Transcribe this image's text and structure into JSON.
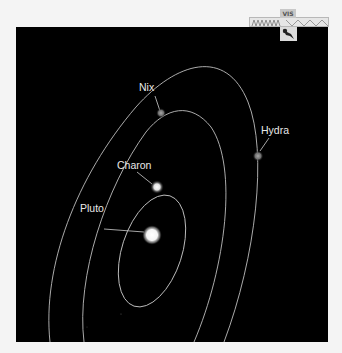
{
  "diagram": {
    "background_color": "#000000",
    "orbit_color": "#bdbdbd",
    "label_color": "#e8e8e8",
    "bodies": [
      {
        "name": "Pluto",
        "label": "Pluto"
      },
      {
        "name": "Charon",
        "label": "Charon"
      },
      {
        "name": "Nix",
        "label": "Nix"
      },
      {
        "name": "Hydra",
        "label": "Hydra"
      }
    ]
  },
  "spacecraft_widget": {
    "tag": "VIS",
    "icon": "spacecraft-icon"
  }
}
